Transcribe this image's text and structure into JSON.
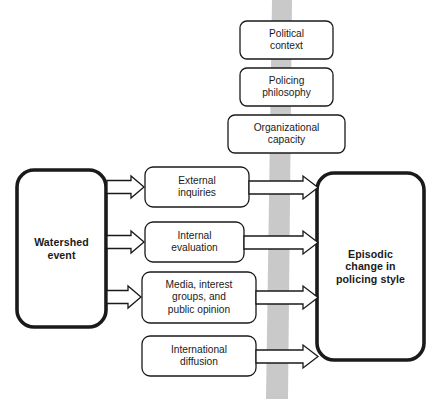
{
  "diagram": {
    "type": "flow-diagram",
    "colors": {
      "stroke": "#1a1a1a",
      "fill": "#ffffff",
      "band": "#c9c9c9",
      "text": "#1a1a1a"
    },
    "context_band": {
      "name": "vertical-context-band",
      "color": "#c9c9c9",
      "orientation": "vertical"
    },
    "context_nodes": [
      {
        "id": "political-context",
        "label": "Political\ncontext"
      },
      {
        "id": "policing-philosophy",
        "label": "Policing\nphilosophy"
      },
      {
        "id": "organizational-capacity",
        "label": "Organizational\ncapacity"
      }
    ],
    "source_node": {
      "id": "watershed-event",
      "label": "Watershed\nevent",
      "emphasis": "bold"
    },
    "mediator_nodes": [
      {
        "id": "external-inquiries",
        "label": "External\ninquiries"
      },
      {
        "id": "internal-evaluation",
        "label": "Internal\nevaluation"
      },
      {
        "id": "media-interest-groups",
        "label": "Media, interest\ngroups, and\npublic opinion"
      },
      {
        "id": "international-diffusion",
        "label": "International\ndiffusion"
      }
    ],
    "target_node": {
      "id": "episodic-change",
      "label": "Episodic\nchange in\npolicing style",
      "emphasis": "bold"
    },
    "edges": [
      {
        "id": "edge-watershed-to-external",
        "from": "watershed-event",
        "to": "external-inquiries",
        "style": "block-arrow"
      },
      {
        "id": "edge-watershed-to-internal",
        "from": "watershed-event",
        "to": "internal-evaluation",
        "style": "block-arrow"
      },
      {
        "id": "edge-watershed-to-media",
        "from": "watershed-event",
        "to": "media-interest-groups",
        "style": "block-arrow"
      },
      {
        "id": "edge-external-to-episodic",
        "from": "external-inquiries",
        "to": "episodic-change",
        "style": "block-arrow"
      },
      {
        "id": "edge-internal-to-episodic",
        "from": "internal-evaluation",
        "to": "episodic-change",
        "style": "block-arrow"
      },
      {
        "id": "edge-media-to-episodic",
        "from": "media-interest-groups",
        "to": "episodic-change",
        "style": "block-arrow"
      },
      {
        "id": "edge-international-to-episodic",
        "from": "international-diffusion",
        "to": "episodic-change",
        "style": "block-arrow"
      }
    ]
  }
}
